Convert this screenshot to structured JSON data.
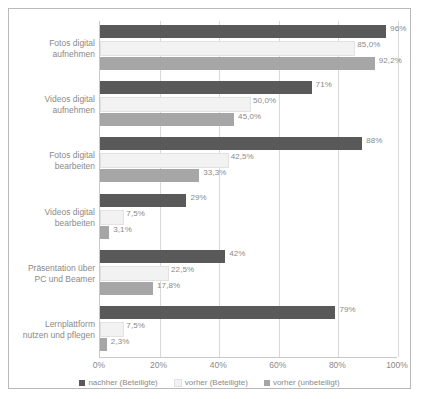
{
  "chart_data": {
    "type": "bar",
    "orientation": "horizontal",
    "title": "",
    "xlabel": "",
    "ylabel": "",
    "xlim": [
      0,
      100
    ],
    "xticks": [
      "0%",
      "20%",
      "40%",
      "60%",
      "80%",
      "100%"
    ],
    "xtick_values": [
      0,
      20,
      40,
      60,
      80,
      100
    ],
    "grid": true,
    "legend_position": "bottom",
    "categories": [
      "Fotos digital\naufnehmen",
      "Videos digital\naufnehmen",
      "Fotos digital\nbearbeiten",
      "Videos digital\nbearbeiten",
      "Präsentation über\nPC und Beamer",
      "Lernplattform\nnutzen und pflegen"
    ],
    "series": [
      {
        "name": "nachher (Beteiligte)",
        "color": "#595959",
        "values": [
          96,
          71,
          88,
          29,
          42,
          79
        ],
        "labels": [
          "96%",
          "71%",
          "88%",
          "29%",
          "42%",
          "79%"
        ]
      },
      {
        "name": "vorher (Beteiligte)",
        "color": "#f2f2f2",
        "values": [
          85.0,
          50.0,
          42.5,
          7.5,
          22.5,
          7.5
        ],
        "labels": [
          "85,0%",
          "50,0%",
          "42,5%",
          "7,5%",
          "22,5%",
          "7,5%"
        ]
      },
      {
        "name": "vorher (unbeteiligt)",
        "color": "#a6a6a6",
        "values": [
          92.2,
          45.0,
          33.3,
          3.1,
          17.8,
          2.3
        ],
        "labels": [
          "92,2%",
          "45,0%",
          "33,3%",
          "3,1%",
          "17,8%",
          "2,3%"
        ]
      }
    ]
  }
}
